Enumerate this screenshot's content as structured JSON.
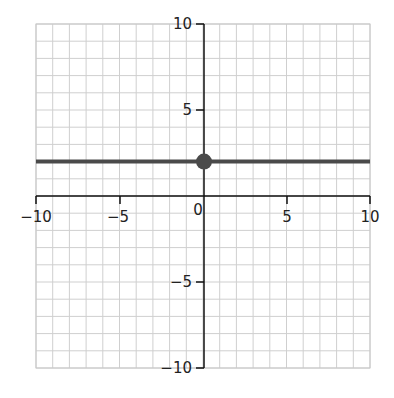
{
  "chart_data": {
    "type": "line",
    "title": "",
    "xlabel": "",
    "ylabel": "",
    "xlim": [
      -10,
      10
    ],
    "ylim": [
      -10,
      10
    ],
    "grid": true,
    "grid_step": 1,
    "x_tick_labels": [
      "−10",
      "−5",
      "0",
      "5",
      "10"
    ],
    "y_tick_labels": [
      "10",
      "5",
      "−5",
      "−10"
    ],
    "series": [
      {
        "name": "y = 2",
        "type": "line",
        "x": [
          -10,
          10
        ],
        "y": [
          2,
          2
        ],
        "color": "#4a4a4a"
      },
      {
        "name": "y-intercept",
        "type": "scatter",
        "x": [
          0
        ],
        "y": [
          2
        ],
        "color": "#4a4a4a"
      }
    ]
  },
  "labels": {
    "x_neg10": "−10",
    "x_neg5": "−5",
    "origin": "0",
    "x_5": "5",
    "x_10": "10",
    "y_10": "10",
    "y_5": "5",
    "y_neg5": "−5",
    "y_neg10": "−10"
  }
}
